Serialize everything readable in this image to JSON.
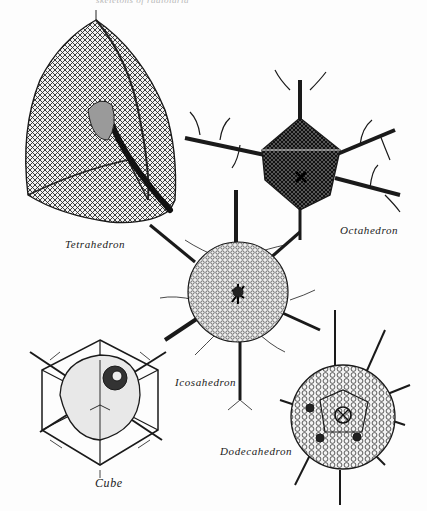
{
  "page": {
    "running_head": "skeletons of radiolaria",
    "background": "#fdfdfd",
    "ink_color": "#1a1a1a"
  },
  "figures": [
    {
      "id": "tetrahedron",
      "label": "Tetrahedron"
    },
    {
      "id": "octahedron",
      "label": "Octahedron"
    },
    {
      "id": "icosahedron",
      "label": "Icosahedron"
    },
    {
      "id": "cube",
      "label": "Cube"
    },
    {
      "id": "dodecahedron",
      "label": "Dodecahedron"
    }
  ]
}
